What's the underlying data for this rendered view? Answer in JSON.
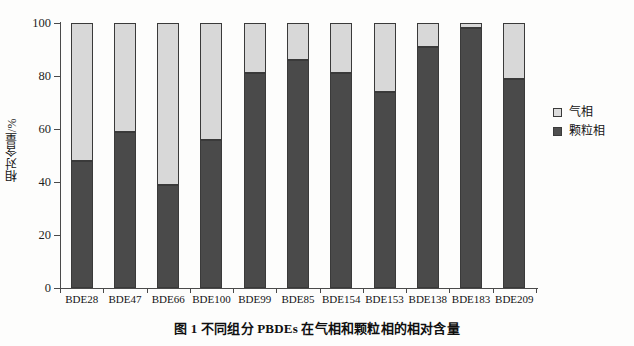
{
  "chart_data": {
    "type": "bar",
    "subtype": "stacked-100-percent",
    "title": "",
    "caption": "图 1    不同组分 PBDEs 在气相和颗粒相的相对含量",
    "xlabel": "",
    "ylabel": "相对含量/%",
    "ylim": [
      0,
      100
    ],
    "yticks": [
      0,
      20,
      40,
      60,
      80,
      100
    ],
    "ytick_labels": [
      "0",
      "20",
      "40",
      "60",
      "80",
      "100"
    ],
    "grid": false,
    "legend_position": "right",
    "categories": [
      "BDE28",
      "BDE47",
      "BDE66",
      "BDE100",
      "BDE99",
      "BDE85",
      "BDE154",
      "BDE153",
      "BDE138",
      "BDE183",
      "BDE209"
    ],
    "series": [
      {
        "name": "气相",
        "color": "#d8d8d8",
        "values": [
          52,
          41,
          61,
          44,
          19,
          14,
          19,
          26,
          9,
          2,
          21
        ]
      },
      {
        "name": "颗粒相",
        "color": "#4a4a4a",
        "values": [
          48,
          59,
          39,
          56,
          81,
          86,
          81,
          74,
          91,
          98,
          79
        ]
      }
    ]
  },
  "legend": {
    "items": [
      {
        "label": "气相",
        "swatch": "gas"
      },
      {
        "label": "颗粒相",
        "swatch": "particle"
      }
    ]
  },
  "colors": {
    "gas_phase": "#d8d8d8",
    "particle_phase": "#4a4a4a",
    "axis": "#4a4a4a",
    "text": "#141414",
    "background": "#fdfdfc"
  }
}
